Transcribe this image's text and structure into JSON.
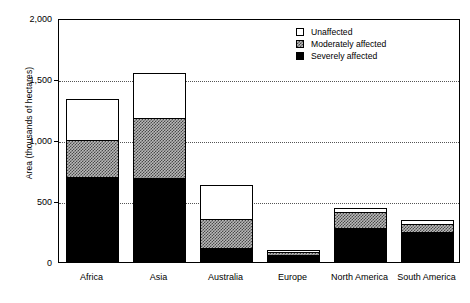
{
  "chart_data": {
    "type": "bar",
    "stacked": true,
    "title": "",
    "xlabel": "",
    "ylabel": "Area (thousands of hectares)",
    "ylim": [
      0,
      2000
    ],
    "yticks": [
      0,
      500,
      1000,
      1500,
      2000
    ],
    "ytick_labels": [
      "0",
      "500",
      "1,000",
      "1,500",
      "2,000"
    ],
    "grid": true,
    "grid_axis": "y",
    "legend_position": "top-right",
    "categories": [
      "Africa",
      "Asia",
      "Australia",
      "Europe",
      "North America",
      "South America"
    ],
    "series": [
      {
        "name": "Severely affected",
        "values": [
          700,
          690,
          115,
          60,
          280,
          245
        ]
      },
      {
        "name": "Moderately affected",
        "values": [
          300,
          490,
          235,
          25,
          130,
          65
        ]
      },
      {
        "name": "Unaffected",
        "values": [
          340,
          370,
          280,
          10,
          30,
          35
        ]
      }
    ],
    "totals": [
      1340,
      1550,
      630,
      95,
      440,
      345
    ]
  },
  "legend": {
    "items": [
      {
        "label": "Unaffected",
        "swatch": "white-open"
      },
      {
        "label": "Moderately affected",
        "swatch": "gray-checkered"
      },
      {
        "label": "Severely affected",
        "swatch": "solid-black"
      }
    ]
  },
  "colors": {
    "severe": "#000000",
    "moderate": "#b9b9b9",
    "unaffected": "#ffffff",
    "axis": "#000000",
    "grid": "#555555"
  }
}
